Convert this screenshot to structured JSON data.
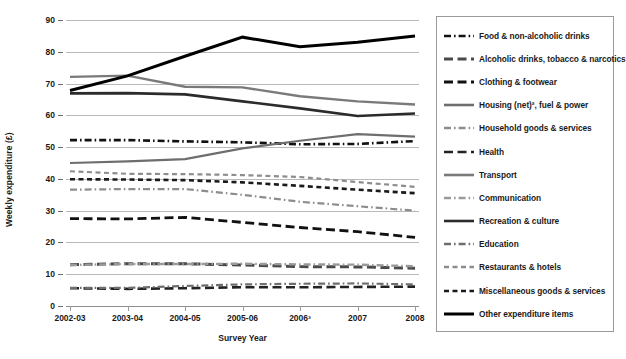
{
  "chart_data": {
    "type": "line",
    "title": "",
    "xlabel": "Survey Year",
    "ylabel": "Weekly expenditure (£)",
    "categories": [
      "2002-03",
      "2003-04",
      "2004-05",
      "2005-06",
      "2006³",
      "2007",
      "2008"
    ],
    "ylim": [
      0,
      90
    ],
    "ytick_values": [
      0,
      10,
      20,
      30,
      40,
      50,
      60,
      70,
      80,
      90
    ],
    "grid": true,
    "legend_position": "right",
    "series": [
      {
        "name": "Food & non-alcoholic drinks",
        "color": "#111111",
        "style": "dash-dot",
        "width": 2.6,
        "values": [
          52.2,
          52.2,
          51.8,
          51.5,
          50.9,
          51.0,
          51.9
        ]
      },
      {
        "name": "Alcoholic drinks, tobacco & narcotics",
        "color": "#4a4a4a",
        "style": "long-dash",
        "width": 3.0,
        "values": [
          13.0,
          13.3,
          13.3,
          12.9,
          12.4,
          12.3,
          11.9
        ]
      },
      {
        "name": "Clothing & footwear",
        "color": "#111111",
        "style": "long-dash",
        "width": 2.8,
        "values": [
          27.5,
          27.4,
          27.9,
          26.3,
          24.7,
          23.4,
          21.6
        ]
      },
      {
        "name": "Housing (net)², fuel & power",
        "color": "#6e6e6e",
        "style": "solid",
        "width": 2.2,
        "values": [
          45.0,
          45.5,
          46.2,
          49.6,
          52.0,
          54.1,
          53.3
        ]
      },
      {
        "name": "Household goods & services",
        "color": "#8d8d8d",
        "style": "dash-dot",
        "width": 2.2,
        "values": [
          36.6,
          36.8,
          36.8,
          35.0,
          32.8,
          31.4,
          30.0
        ]
      },
      {
        "name": "Health",
        "color": "#222222",
        "style": "long-dash",
        "width": 2.6,
        "values": [
          5.6,
          5.4,
          5.6,
          5.9,
          5.9,
          6.0,
          6.1
        ]
      },
      {
        "name": "Transport",
        "color": "#7a7a7a",
        "style": "solid",
        "width": 2.4,
        "values": [
          72.1,
          72.5,
          69.0,
          68.8,
          66.0,
          64.4,
          63.4
        ]
      },
      {
        "name": "Communication",
        "color": "#9a9a9a",
        "style": "dash-dot",
        "width": 2.4,
        "values": [
          12.9,
          13.2,
          13.2,
          13.3,
          13.1,
          13.0,
          12.5
        ]
      },
      {
        "name": "Recreation & culture",
        "color": "#2b2b2b",
        "style": "solid",
        "width": 2.6,
        "values": [
          66.9,
          67.0,
          66.6,
          64.4,
          62.2,
          59.8,
          60.6
        ]
      },
      {
        "name": "Education",
        "color": "#6e6e6e",
        "style": "dash-dot",
        "width": 2.2,
        "values": [
          5.7,
          5.7,
          6.3,
          6.8,
          7.0,
          7.1,
          6.8
        ]
      },
      {
        "name": "Restaurants & hotels",
        "color": "#8d8d8d",
        "style": "short-dash",
        "width": 2.2,
        "values": [
          42.4,
          41.6,
          41.5,
          41.2,
          40.6,
          39.0,
          37.5
        ]
      },
      {
        "name": "Miscellaneous goods & services",
        "color": "#1a1a1a",
        "style": "short-dash",
        "width": 2.6,
        "values": [
          39.9,
          39.8,
          39.6,
          38.9,
          37.8,
          36.6,
          35.5
        ]
      },
      {
        "name": "Other expenditure items",
        "color": "#000000",
        "style": "solid",
        "width": 3.0,
        "values": [
          67.8,
          72.4,
          78.6,
          84.6,
          81.6,
          83.0,
          85.0
        ]
      }
    ]
  }
}
